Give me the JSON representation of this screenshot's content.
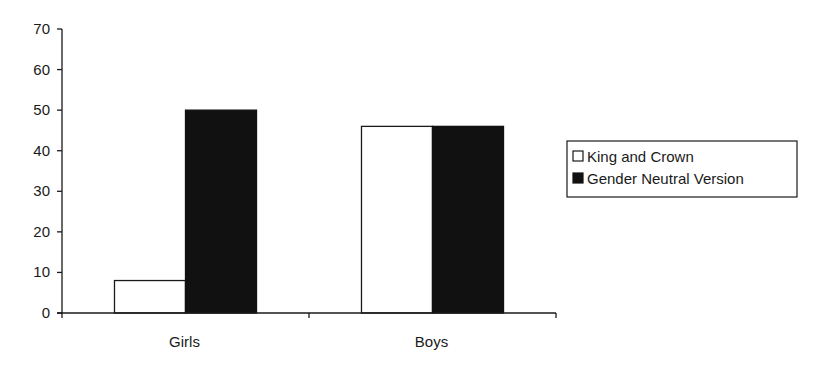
{
  "chart_data": {
    "type": "bar",
    "title": "",
    "xlabel": "",
    "ylabel": "",
    "categories": [
      "Girls",
      "Boys"
    ],
    "series": [
      {
        "name": "King and Crown",
        "values": [
          8,
          46
        ],
        "color": "#ffffff",
        "stroke": "#1a1a1a"
      },
      {
        "name": "Gender Neutral Version",
        "values": [
          50,
          46
        ],
        "color": "#111111",
        "stroke": "#111111"
      }
    ],
    "ylim": [
      0,
      70
    ],
    "yticks": [
      0,
      10,
      20,
      30,
      40,
      50,
      60,
      70
    ],
    "grid": false,
    "legend": {
      "position": "right",
      "entries": [
        "King and Crown",
        "Gender Neutral Version"
      ]
    }
  }
}
